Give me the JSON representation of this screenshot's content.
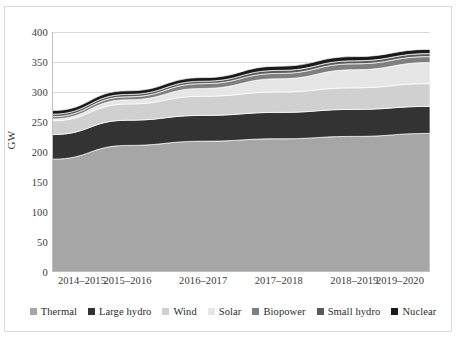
{
  "chart": {
    "type": "area",
    "ylabel": "GW",
    "y_ticks": [
      "400",
      "350",
      "300",
      "250",
      "200",
      "150",
      "100",
      "50",
      "0"
    ],
    "x_ticks": [
      "2014–2015",
      "2015–2016",
      "2016–2017",
      "2017–2018",
      "2018–2019",
      "2019–2020"
    ],
    "legend_position": "bottom"
  },
  "chart_data": {
    "type": "area",
    "stacked": true,
    "title": "",
    "xlabel": "",
    "ylabel": "GW",
    "ylim": [
      0,
      400
    ],
    "ytick_step": 50,
    "grid": true,
    "categories": [
      "2014–2015",
      "2015–2016",
      "2016–2017",
      "2017–2018",
      "2018–2019",
      "2019–2020"
    ],
    "series": [
      {
        "name": "Thermal",
        "color": "#a6a6a6",
        "values": [
          188,
          211,
          218,
          222,
          226,
          231
        ]
      },
      {
        "name": "Large hydro",
        "color": "#333333",
        "values": [
          41,
          42,
          43,
          44,
          45,
          45
        ]
      },
      {
        "name": "Wind",
        "color": "#d0d0d0",
        "values": [
          23,
          27,
          32,
          34,
          36,
          38
        ]
      },
      {
        "name": "Solar",
        "color": "#e6e6e6",
        "values": [
          3,
          7,
          13,
          22,
          30,
          35
        ]
      },
      {
        "name": "Biopower",
        "color": "#7f7f7f",
        "values": [
          4,
          5,
          8,
          9,
          10,
          10
        ]
      },
      {
        "name": "Small hydro",
        "color": "#5a5a5a",
        "values": [
          4,
          4,
          4,
          5,
          5,
          5
        ]
      },
      {
        "name": "Nuclear",
        "color": "#1a1a1a",
        "values": [
          6,
          6,
          6,
          7,
          7,
          7
        ]
      }
    ],
    "totals": [
      269,
      302,
      324,
      343,
      359,
      371
    ],
    "legend": [
      "Thermal",
      "Large hydro",
      "Wind",
      "Solar",
      "Biopower",
      "Small hydro",
      "Nuclear"
    ]
  },
  "colors": {
    "plot_background": "#ffffff",
    "gridline": "#d9d9d9",
    "border": "#d9d9d9",
    "text": "#3a3a3a"
  }
}
